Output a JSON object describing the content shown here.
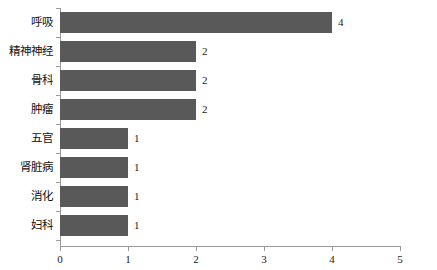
{
  "chart_data": {
    "type": "bar",
    "orientation": "horizontal",
    "title": "",
    "subtitle": "",
    "xlabel": "",
    "ylabel": "",
    "categories": [
      "呼吸",
      "精神神经",
      "骨科",
      "肿瘤",
      "五官",
      "肾脏病",
      "消化",
      "妇科"
    ],
    "values": [
      4,
      2,
      2,
      2,
      1,
      1,
      1,
      1
    ],
    "value_labels": [
      "4",
      "2",
      "2",
      "2",
      "1",
      "1",
      "1",
      "1"
    ],
    "xlim": [
      0,
      5
    ],
    "xticks": [
      0,
      1,
      2,
      3,
      4,
      5
    ],
    "xtick_labels": [
      "0",
      "1",
      "2",
      "3",
      "4",
      "5"
    ],
    "grid": false,
    "legend": false,
    "bar_color": "#595959",
    "axis_color": "#9a9a9a",
    "background": "#ffffff"
  }
}
